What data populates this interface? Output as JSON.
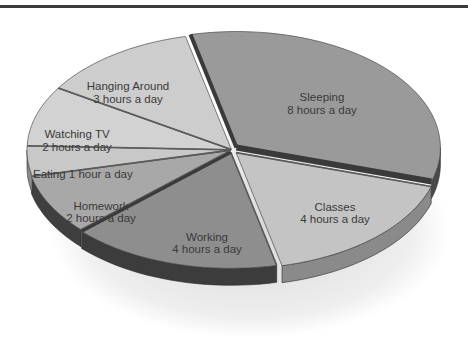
{
  "chart_data": {
    "type": "pie",
    "title": "",
    "style": "3d-exploded",
    "units": "hours a day",
    "total": 24,
    "slices": [
      {
        "label": "Sleeping",
        "value": 8,
        "caption": "8 hours a day",
        "color": "#9a9a9a",
        "side": "#4a4a4a"
      },
      {
        "label": "Classes",
        "value": 4,
        "caption": "4 hours a day",
        "color": "#c4c4c4",
        "side": "#8a8a8a"
      },
      {
        "label": "Working",
        "value": 4,
        "caption": "4 hours a day",
        "color": "#8e8e8e",
        "side": "#3c3c3c"
      },
      {
        "label": "Homework",
        "value": 2,
        "caption": "2 hours a day",
        "color": "#a8a8a8",
        "side": "#3f3f3f"
      },
      {
        "label": "Eating",
        "value": 1,
        "caption": "Eating 1 hour a day",
        "color": "#c8c8c8",
        "side": "#8c8c8c"
      },
      {
        "label": "Watching TV",
        "value": 2,
        "caption": "2 hours a day",
        "color": "#d2d2d2",
        "side": "#9a9a9a"
      },
      {
        "label": "Hanging Around",
        "value": 3,
        "caption": "3 hours a day",
        "color": "#cdcdcd",
        "side": "#959595"
      }
    ]
  },
  "labels": {
    "sleeping": {
      "name": "Sleeping",
      "sub": "8 hours a day"
    },
    "classes": {
      "name": "Classes",
      "sub": "4 hours a day"
    },
    "working": {
      "name": "Working",
      "sub": "4 hours a day"
    },
    "homework": {
      "name": "Homework",
      "sub": "2 hours a day"
    },
    "eating": {
      "name": "Eating 1 hour a day"
    },
    "tv": {
      "name": "Watching TV",
      "sub": "2 hours a day"
    },
    "hanging": {
      "name": "Hanging Around",
      "sub": "3 hours a day"
    }
  }
}
